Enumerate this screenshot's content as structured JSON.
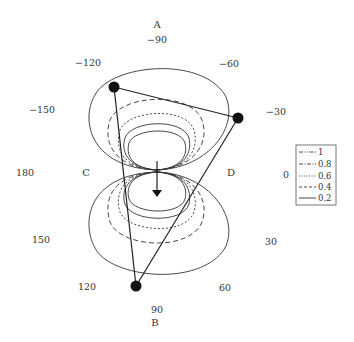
{
  "diagram": {
    "type": "polar directivity pattern with triangle",
    "points": {
      "top": "A",
      "bottom": "B",
      "left": "C",
      "right": "D"
    },
    "angle_labels": {
      "a_neg90": "−90",
      "a_neg120": "−120",
      "a_neg60": "−60",
      "a_neg150": "−150",
      "a_neg30": "−30",
      "a_180": "180",
      "a_0": "0",
      "a_150": "150",
      "a_30": "30",
      "a_120": "120",
      "a_60": "60",
      "a_90": "90"
    },
    "legend": {
      "items": [
        {
          "label": "1",
          "style": "dash-dot-dot"
        },
        {
          "label": "0.8",
          "style": "dash-dot"
        },
        {
          "label": "0.6",
          "style": "dotted"
        },
        {
          "label": "0.4",
          "style": "dashed"
        },
        {
          "label": "0.2",
          "style": "solid"
        }
      ]
    },
    "triangle_vertices": [
      {
        "x": 114,
        "y": 87
      },
      {
        "x": 238,
        "y": 118
      },
      {
        "x": 136,
        "y": 286
      }
    ],
    "arrow": {
      "direction": "down"
    },
    "colors": {
      "line": "#333333",
      "fill": "#111111",
      "background": "#ffffff"
    }
  }
}
